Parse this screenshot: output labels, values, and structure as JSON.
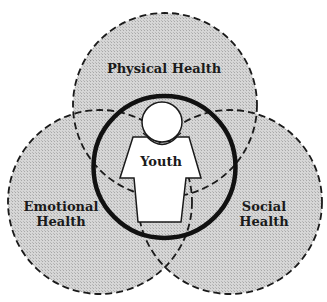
{
  "diagram": {
    "type": "venn",
    "center_figure": {
      "label": "Youth",
      "icon": "person-icon"
    },
    "circles": [
      {
        "id": "physical",
        "lines": [
          "Physical Health"
        ]
      },
      {
        "id": "emotional",
        "lines": [
          "Emotional",
          "Health"
        ]
      },
      {
        "id": "social",
        "lines": [
          "Social",
          "Health"
        ]
      }
    ],
    "colors": {
      "circle_fill": "#cfcfcf",
      "outline": "#1a1a1a",
      "figure_fill": "#ffffff",
      "background": "#ffffff"
    }
  }
}
